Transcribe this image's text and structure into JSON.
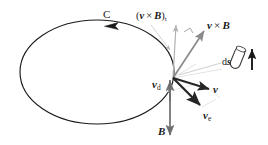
{
  "figure": {
    "background_color": "#ffffff",
    "width": 268,
    "height": 145,
    "colors": {
      "curve": "#1a1a1a",
      "dark_vector": "#262626",
      "gray_vector": "#8a8a8a",
      "light_guide": "#c8c8c8",
      "label_text": "#1a1a1a"
    },
    "loop": {
      "name": "closed-circuit-loop",
      "shape": "ellipse",
      "center_x": 97,
      "center_y": 72,
      "radius_x": 77,
      "radius_y": 52,
      "direction": "counterclockwise",
      "direction_marker": "left-pointing arrowhead on top arc"
    },
    "origin_point": {
      "x": 173,
      "y": 78
    },
    "labels": [
      {
        "id": "label-C",
        "name": "curve-label-C",
        "text": "C",
        "style": "roman",
        "x": 103,
        "y": 9,
        "description": "Name of the closed curve / circuit"
      },
      {
        "id": "label-vxBt",
        "name": "tangential-v-cross-B-label",
        "text": "(v × B)t",
        "head": "(",
        "v": "v",
        "times": "×",
        "b": "B",
        "close": ")",
        "subscript": "t",
        "x": 136,
        "y": 11,
        "description": "Tangential component of v cross B"
      },
      {
        "id": "label-vxB",
        "name": "v-cross-B-label",
        "text": "v × B",
        "v": "v",
        "times": "×",
        "b": "B",
        "x": 207,
        "y": 20,
        "description": "Magnetic force per unit charge vector"
      },
      {
        "id": "label-ds",
        "name": "line-element-ds-label",
        "text": "ds",
        "d": "d",
        "s": "s",
        "x": 222,
        "y": 57,
        "description": "Differential line element of the circuit"
      },
      {
        "id": "label-vd",
        "name": "drift-velocity-label",
        "text": "vd",
        "v": "v",
        "subscript": "d",
        "x": 152,
        "y": 79,
        "description": "Drift velocity of charge carriers"
      },
      {
        "id": "label-v",
        "name": "velocity-label",
        "text": "v",
        "v": "v",
        "x": 213,
        "y": 84,
        "description": "Total charge velocity"
      },
      {
        "id": "label-ve",
        "name": "element-velocity-label",
        "text": "ve",
        "v": "v",
        "subscript": "e",
        "x": 203,
        "y": 110,
        "description": "Velocity of the circuit element"
      },
      {
        "id": "label-B",
        "name": "magnetic-field-label",
        "text": "B",
        "b": "B",
        "x": 158,
        "y": 126,
        "description": "Magnetic flux density vector"
      }
    ],
    "vectors": [
      {
        "name": "v-cross-B-vector",
        "from": [
          173,
          78
        ],
        "to": [
          203,
          32
        ],
        "color": "#8a8a8a",
        "weight": 1.6,
        "label": "v × B"
      },
      {
        "name": "tangential-component-vector",
        "from": [
          173,
          78
        ],
        "to": [
          176,
          26
        ],
        "color": "#a8a8a8",
        "weight": 1.1,
        "label": "(v × B)t"
      },
      {
        "name": "velocity-v-vector",
        "from": [
          173,
          78
        ],
        "to": [
          210,
          90
        ],
        "color": "#262626",
        "weight": 1.9,
        "label": "v"
      },
      {
        "name": "element-velocity-ve-vector",
        "from": [
          173,
          78
        ],
        "to": [
          202,
          107
        ],
        "color": "#262626",
        "weight": 2.2,
        "label": "ve"
      },
      {
        "name": "drift-velocity-vd-vector",
        "from": [
          170,
          100
        ],
        "to": [
          170,
          80
        ],
        "color": "#6e6e6e",
        "weight": 1.8,
        "label": "vd"
      },
      {
        "name": "magnetic-field-B-vector",
        "from": [
          170,
          80
        ],
        "to": [
          170,
          136
        ],
        "color": "#6e6e6e",
        "weight": 1.8,
        "label": "B"
      }
    ],
    "guides": [
      {
        "name": "ds-leader-line",
        "from": [
          178,
          76
        ],
        "to": [
          222,
          63
        ]
      },
      {
        "name": "vxBt-leader-line",
        "from": [
          152,
          24
        ],
        "to": [
          172,
          52
        ]
      },
      {
        "name": "parallelogram-edge-upper",
        "from": [
          173,
          78
        ],
        "to": [
          221,
          70
        ]
      },
      {
        "name": "parallelogram-edge-v",
        "from": [
          210,
          90
        ],
        "to": [
          219,
          97
        ]
      },
      {
        "name": "parallelogram-edge-ve",
        "from": [
          202,
          107
        ],
        "to": [
          214,
          99
        ]
      }
    ],
    "right_angle_marker": {
      "name": "right-angle-marker",
      "x": 188,
      "y": 30,
      "size": 7,
      "description": "Perpendicularity mark between tangential component and v cross B"
    },
    "ds_glyph": {
      "name": "ds-cylinder-glyph",
      "description": "small tilted capsule (current element) with an upward arrow beside it",
      "cylinder_x": 237,
      "cylinder_y": 52,
      "arrow_x": 253,
      "arrow_top_y": 50,
      "arrow_bottom_y": 70
    }
  }
}
